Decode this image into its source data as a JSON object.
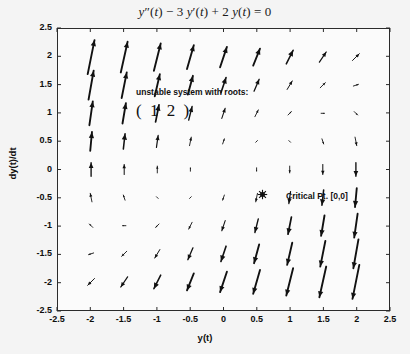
{
  "figure": {
    "title_parts": [
      {
        "t": "y",
        "style": "italic"
      },
      {
        "t": "″",
        "style": "normal"
      },
      {
        "t": "(",
        "style": "normal"
      },
      {
        "t": "t",
        "style": "italic"
      },
      {
        "t": ") − 3 ",
        "style": "normal"
      },
      {
        "t": "y",
        "style": "italic"
      },
      {
        "t": "′",
        "style": "normal"
      },
      {
        "t": "(",
        "style": "normal"
      },
      {
        "t": "t",
        "style": "italic"
      },
      {
        "t": ") + 2 ",
        "style": "normal"
      },
      {
        "t": "y",
        "style": "italic"
      },
      {
        "t": "(",
        "style": "normal"
      },
      {
        "t": "t",
        "style": "italic"
      },
      {
        "t": ") = 0",
        "style": "normal"
      }
    ],
    "title_plain": "y''(t) - 3 y'(t) + 2 y(t) = 0",
    "background_color": "#f4f4f4",
    "axes_color": "#2b2b2b",
    "arrow_color": "#111111"
  },
  "annotations": {
    "roots_text": "unstable system with roots:",
    "roots_matrix": "( 1   2 )",
    "roots_values": [
      1,
      2
    ],
    "critical_point_label": "Critical Pt. [0,0]",
    "critical_point": [
      0,
      0
    ],
    "critical_marker_icon": "hexagram-marker"
  },
  "chart_data": {
    "type": "scatter",
    "subtype": "quiver-direction-field",
    "xlabel": "y(t)",
    "ylabel": "dy(t)/dt",
    "xlim": [
      -2.5,
      2.5
    ],
    "ylim": [
      -2.5,
      2.5
    ],
    "xticks": [
      -2.5,
      -2,
      -1.5,
      -1,
      -0.5,
      0,
      0.5,
      1,
      1.5,
      2,
      2.5
    ],
    "yticks": [
      -2.5,
      -2,
      -1.5,
      -1,
      -0.5,
      0,
      0.5,
      1,
      1.5,
      2,
      2.5
    ],
    "xticklabels": [
      "-2.5",
      "-2",
      "-1.5",
      "-1",
      "-0.5",
      "0",
      "0.5",
      "1",
      "1.5",
      "2",
      "2.5"
    ],
    "yticklabels": [
      "-2.5",
      "-2",
      "-1.5",
      "-1",
      "-0.5",
      "0",
      "0.5",
      "1",
      "1.5",
      "2",
      "2.5"
    ],
    "grid": false,
    "legend": false,
    "grid_x": [
      -2,
      -1.5,
      -1,
      -0.5,
      0,
      0.5,
      1,
      1.5,
      2
    ],
    "grid_y": [
      -2,
      -1.5,
      -1,
      -0.5,
      0,
      0.5,
      1,
      1.5,
      2
    ],
    "vector_field": {
      "u_expr": "v",
      "v_expr": "3*v - 2*u",
      "description": "dy/dt = v ; dv/dt = 3v - 2y",
      "eigenvalues": [
        1,
        2
      ],
      "classification": "unstable node"
    },
    "critical_points": [
      {
        "x": 0,
        "y": 0,
        "label": "Critical Pt. [0,0]"
      }
    ]
  },
  "axes": {
    "xlabel": "y(t)",
    "ylabel": "dy(t)/dt"
  }
}
